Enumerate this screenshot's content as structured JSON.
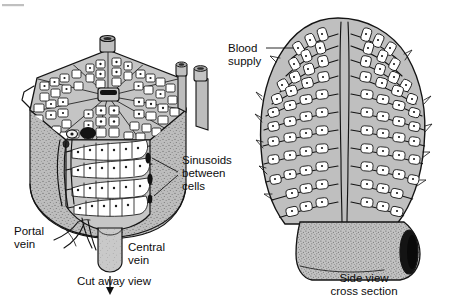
{
  "figure": {
    "background_color": "#ffffff",
    "ink_color": "#141414",
    "tissue_color": "#b9b9b9",
    "cell_fill_color": "#ffffff",
    "nucleus_color": "#1a1a1a",
    "lumen_color": "#121212"
  },
  "panels": {
    "left": {
      "caption": "Cut away view",
      "caption_lines": [
        "Cut away view"
      ],
      "shape": "hexagonal lobule with wedge removed"
    },
    "right": {
      "caption_lines": [
        "Side view",
        "cross section"
      ],
      "caption_line1": "Side view",
      "caption_line2": "cross section",
      "shape": "oval lobule cut lengthwise on a vessel"
    }
  },
  "labels": {
    "blood_supply": {
      "lines": [
        "Blood",
        "supply"
      ],
      "line1": "Blood",
      "line2": "supply",
      "leader": "horizontal line to left edge of side view"
    },
    "sinusoids": {
      "lines": [
        "Sinusoids",
        "between",
        "cells"
      ],
      "line1": "Sinusoids",
      "line2": "between",
      "line3": "cells",
      "leader": "two lines converging to cut face channels"
    },
    "portal_vein": {
      "lines": [
        "Portal",
        "vein"
      ],
      "line1": "Portal",
      "line2": "vein"
    },
    "central_vein": {
      "lines": [
        "Central",
        "vein"
      ],
      "line1": "Central",
      "line2": "vein",
      "flow_arrow": "downward arrow below central vein stump"
    }
  }
}
